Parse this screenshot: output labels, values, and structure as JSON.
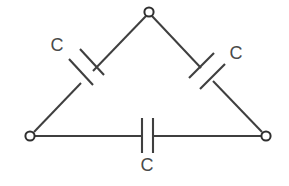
{
  "figure": {
    "background_color": "#ffffff",
    "line_color": "#3f3f3f",
    "label_color": "#4a4a4a"
  },
  "circuit": {
    "topology": "delta",
    "terminals": [
      {
        "id": "apex",
        "name": "top-terminal",
        "x": 149,
        "y": 12
      },
      {
        "id": "left",
        "name": "left-terminal",
        "x": 30,
        "y": 136
      },
      {
        "id": "right",
        "name": "right-terminal",
        "x": 266,
        "y": 136
      }
    ],
    "branches": [
      {
        "id": "left-branch",
        "from": "left",
        "to": "apex",
        "component": "capacitor",
        "label": "C",
        "label_x": 57,
        "label_y": 51,
        "cap_center_x": 87,
        "cap_center_y": 77
      },
      {
        "id": "right-branch",
        "from": "apex",
        "to": "right",
        "component": "capacitor",
        "label": "C",
        "label_x": 236,
        "label_y": 59,
        "cap_center_x": 207,
        "cap_center_y": 75
      },
      {
        "id": "bottom-branch",
        "from": "left",
        "to": "right",
        "component": "capacitor",
        "label": "C",
        "label_x": 147,
        "label_y": 171,
        "cap_center_x": 147,
        "cap_center_y": 136
      }
    ]
  },
  "labels": {
    "left_capacitor": "C",
    "right_capacitor": "C",
    "bottom_capacitor": "C"
  }
}
